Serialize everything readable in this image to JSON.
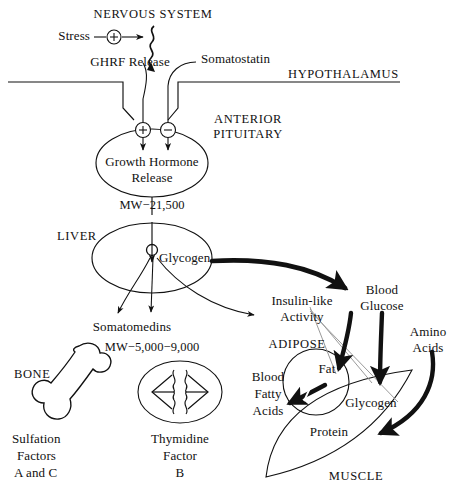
{
  "figure": {
    "background_color": "#ffffff",
    "ink_color": "#111111",
    "thin_line_color": "#9a9a9a"
  },
  "labels": {
    "nervous_system": "NERVOUS SYSTEM",
    "stress": "Stress",
    "ghrf_release": "GHRF Release",
    "somatostatin": "Somatostatin",
    "hypothalamus": "HYPOTHALAMUS",
    "anterior": "ANTERIOR",
    "pituitary": "PITUITARY",
    "growth_hormone": "Growth Hormone",
    "release": "Release",
    "mw_gh": "MW−21,500",
    "liver": "LIVER",
    "glycogen_liver": "Glycogen",
    "somatomedins": "Somatomedins",
    "mw_somatomedins": "MW−5,000−9,000",
    "bone": "BONE",
    "sulfation_1": "Sulfation",
    "sulfation_2": "Factors",
    "sulfation_3": "A and C",
    "thymidine_1": "Thymidine",
    "thymidine_2": "Factor",
    "thymidine_3": "B",
    "insulin_like_1": "Insulin-like",
    "insulin_like_2": "Activity",
    "blood_1": "Blood",
    "glucose_2": "Glucose",
    "amino_1": "Amino",
    "acids_2": "Acids",
    "adipose": "ADIPOSE",
    "fat": "Fat",
    "blood_fatty_1": "Blood",
    "blood_fatty_2": "Fatty",
    "blood_fatty_3": "Acids",
    "glycogen_muscle": "Glycogen",
    "protein": "Protein",
    "muscle": "MUSCLE",
    "plus_sign": "+",
    "minus_sign": "−"
  },
  "nodes": [
    {
      "name": "nervous-system",
      "type": "section-label"
    },
    {
      "name": "stress-input",
      "type": "input"
    },
    {
      "name": "plus-modulator-stress",
      "type": "sign",
      "value": "+"
    },
    {
      "name": "nerve-impulse",
      "type": "wavy-arrow"
    },
    {
      "name": "ghrf-release",
      "type": "hormone"
    },
    {
      "name": "somatostatin",
      "type": "hormone"
    },
    {
      "name": "hypothalamus",
      "type": "organ"
    },
    {
      "name": "anterior-pituitary",
      "type": "organ",
      "shape": "ellipse"
    },
    {
      "name": "plus-modulator-pituitary",
      "type": "sign",
      "value": "+"
    },
    {
      "name": "minus-modulator-pituitary",
      "type": "sign",
      "value": "−"
    },
    {
      "name": "growth-hormone-release",
      "type": "hormone"
    },
    {
      "name": "liver",
      "type": "organ",
      "shape": "ellipse"
    },
    {
      "name": "liver-glycogen",
      "type": "substrate"
    },
    {
      "name": "somatomedins",
      "type": "hormone"
    },
    {
      "name": "bone",
      "type": "target-tissue",
      "shape": "bone"
    },
    {
      "name": "thymidine-cell",
      "type": "target-tissue",
      "shape": "cell"
    },
    {
      "name": "blood-glucose",
      "type": "substrate"
    },
    {
      "name": "amino-acids",
      "type": "substrate"
    },
    {
      "name": "insulin-like-activity",
      "type": "activity"
    },
    {
      "name": "adipose",
      "type": "organ",
      "shape": "circle"
    },
    {
      "name": "fat",
      "type": "substrate"
    },
    {
      "name": "blood-fatty-acids",
      "type": "substrate"
    },
    {
      "name": "muscle",
      "type": "organ",
      "shape": "lens"
    },
    {
      "name": "muscle-glycogen",
      "type": "substrate"
    },
    {
      "name": "protein",
      "type": "substrate"
    }
  ],
  "edges": [
    {
      "from": "stress",
      "to": "nerve-impulse",
      "sign": "+",
      "style": "thin"
    },
    {
      "from": "nerve-impulse",
      "to": "ghrf-release",
      "style": "wavy"
    },
    {
      "from": "ghrf-release",
      "to": "anterior-pituitary",
      "sign": "+",
      "style": "thin"
    },
    {
      "from": "somatostatin",
      "to": "anterior-pituitary",
      "sign": "−",
      "style": "thin"
    },
    {
      "from": "growth-hormone-release",
      "to": "liver",
      "style": "thin"
    },
    {
      "from": "liver-glycogen",
      "to": "somatomedins",
      "style": "thin"
    },
    {
      "from": "liver-glycogen",
      "to": "insulin-like-activity",
      "style": "thin"
    },
    {
      "from": "liver-glycogen",
      "to": "blood-glucose",
      "style": "thick"
    },
    {
      "from": "blood-glucose",
      "to": "fat",
      "style": "thick"
    },
    {
      "from": "blood-glucose",
      "to": "muscle-glycogen",
      "style": "thick"
    },
    {
      "from": "amino-acids",
      "to": "protein",
      "style": "thick"
    },
    {
      "from": "fat",
      "to": "blood-fatty-acids",
      "style": "thick"
    },
    {
      "from": "insulin-like-activity",
      "to": "fat",
      "style": "hairline"
    },
    {
      "from": "insulin-like-activity",
      "to": "muscle-glycogen",
      "style": "hairline"
    },
    {
      "from": "insulin-like-activity",
      "to": "protein",
      "style": "hairline"
    }
  ]
}
